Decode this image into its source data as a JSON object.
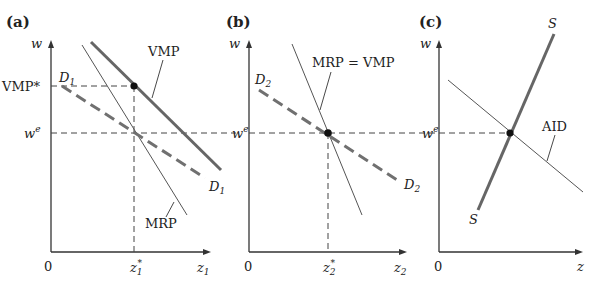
{
  "figure": {
    "panels": [
      {
        "id": "a",
        "label": "(a)",
        "y_axis_label": "w",
        "x_axis_label": "z",
        "x_axis_sub": "1",
        "origin_label": "0",
        "tick_x_label": "z",
        "tick_x_sub": "1",
        "tick_x_sup": "*",
        "tick_y_top_label": "VMP*",
        "tick_y_we_label": "w",
        "tick_y_we_sup": "e",
        "curves": {
          "vmp_label": "VMP",
          "mrp_label": "MRP",
          "d_top_label": "D",
          "d_top_sub": "1",
          "d_bottom_label": "D",
          "d_bottom_sub": "1"
        }
      },
      {
        "id": "b",
        "label": "(b)",
        "y_axis_label": "w",
        "x_axis_label": "z",
        "x_axis_sub": "2",
        "origin_label": "0",
        "tick_x_label": "z",
        "tick_x_sub": "2",
        "tick_x_sup": "*",
        "tick_y_we_label": "w",
        "tick_y_we_sup": "e",
        "curves": {
          "mrp_vmp_label": "MRP = VMP",
          "d_top_label": "D",
          "d_top_sub": "2",
          "d_bottom_label": "D",
          "d_bottom_sub": "2"
        }
      },
      {
        "id": "c",
        "label": "(c)",
        "y_axis_label": "w",
        "x_axis_label": "z",
        "origin_label": "0",
        "tick_y_we_label": "w",
        "tick_y_we_sup": "e",
        "curves": {
          "s_top_label": "S",
          "s_bottom_label": "S",
          "aid_label": "AID"
        }
      }
    ]
  }
}
